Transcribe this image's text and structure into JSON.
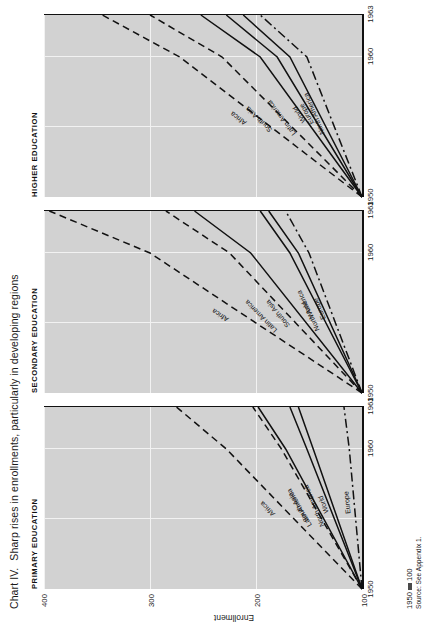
{
  "figure": {
    "caption_lead": "Chart IV.",
    "caption_text": "Sharp rises in enrollments, particularly in developing regions",
    "index_note": "1950",
    "index_equals": "100",
    "source": "Source: See Appendix 1.",
    "y_axis_title": "Enrollment"
  },
  "chart_data": {
    "type": "line",
    "title": "Sharp rises in enrollments, particularly in developing regions",
    "subtitle": "Chart IV.",
    "xlabel": "",
    "ylabel": "Enrollment",
    "note": "1950 = 100",
    "source": "Source: See Appendix 1.",
    "grid": true,
    "legend": "inline-labels",
    "x": [
      1950,
      1960,
      1963
    ],
    "xticks": [
      "1950",
      "1960",
      "1963"
    ],
    "xlim": [
      1950,
      1963
    ],
    "yticks": [
      100,
      200,
      300,
      400
    ],
    "ylim": [
      100,
      400
    ],
    "panels": [
      {
        "title": "PRIMARY EDUCATION",
        "series": [
          {
            "name": "Africa",
            "values": [
              100,
              228,
              275
            ],
            "style": "dashed"
          },
          {
            "name": "South Asia",
            "values": [
              100,
              176,
              203
            ],
            "style": "dashed"
          },
          {
            "name": "Latin America",
            "values": [
              100,
              172,
              198
            ],
            "style": "solid"
          },
          {
            "name": "North America",
            "values": [
              100,
              152,
              168
            ],
            "style": "solid"
          },
          {
            "name": "World",
            "values": [
              100,
              146,
              160
            ],
            "style": "solid"
          },
          {
            "name": "Europe",
            "values": [
              100,
              112,
              117
            ],
            "style": "dashdot"
          }
        ]
      },
      {
        "title": "SECONDARY EDUCATION",
        "series": [
          {
            "name": "Africa",
            "values": [
              100,
              300,
              395
            ],
            "style": "dashed"
          },
          {
            "name": "Latin America",
            "values": [
              100,
              225,
              285
            ],
            "style": "dashed"
          },
          {
            "name": "South Asia",
            "values": [
              100,
              205,
              258
            ],
            "style": "solid"
          },
          {
            "name": "World",
            "values": [
              100,
              168,
              196
            ],
            "style": "solid"
          },
          {
            "name": "North America",
            "values": [
              100,
              160,
              188
            ],
            "style": "solid"
          },
          {
            "name": "Europe",
            "values": [
              100,
              150,
              172
            ],
            "style": "dashdot"
          }
        ]
      },
      {
        "title": "HIGHER EDUCATION",
        "series": [
          {
            "name": "Africa",
            "values": [
              100,
              272,
              345
            ],
            "style": "dashed"
          },
          {
            "name": "South Asia",
            "values": [
              100,
              232,
              300
            ],
            "style": "dashed"
          },
          {
            "name": "Latin America",
            "values": [
              100,
              196,
              252
            ],
            "style": "solid"
          },
          {
            "name": "World",
            "values": [
              100,
              180,
              228
            ],
            "style": "solid"
          },
          {
            "name": "Europe",
            "values": [
              100,
              168,
              212
            ],
            "style": "solid"
          },
          {
            "name": "North America",
            "values": [
              100,
              152,
              196
            ],
            "style": "dashdot"
          }
        ]
      }
    ]
  }
}
